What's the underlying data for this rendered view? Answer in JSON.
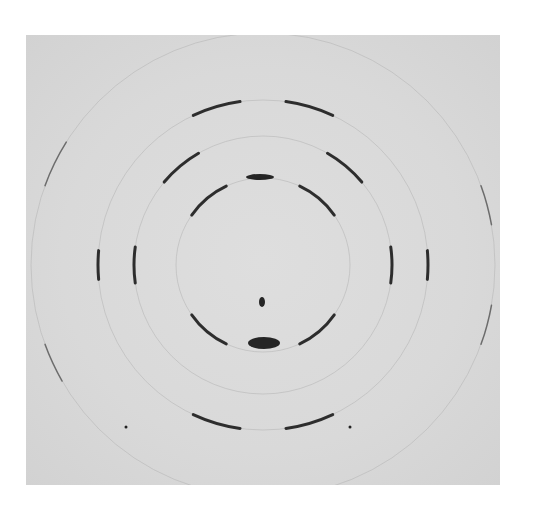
{
  "image": {
    "description": "Fiber X-ray diffraction photograph showing concentric rings with arc-shaped reflections",
    "background_color": "#dadada",
    "spot_color": "#111111",
    "center": [
      237,
      230
    ],
    "rings": [
      {
        "name": "inner",
        "radius": 87,
        "arcs": [
          [
            215,
            245
          ],
          [
            295,
            325
          ],
          [
            35,
            65
          ],
          [
            115,
            145
          ]
        ]
      },
      {
        "name": "middle",
        "radius": 129,
        "arcs": [
          [
            172,
            188
          ],
          [
            -8,
            8
          ],
          [
            220,
            240
          ],
          [
            300,
            320
          ]
        ]
      },
      {
        "name": "large",
        "radius": 165,
        "arcs": [
          [
            245,
            262
          ],
          [
            278,
            295
          ],
          [
            65,
            82
          ],
          [
            98,
            115
          ],
          [
            175,
            185
          ],
          [
            -5,
            5
          ]
        ]
      },
      {
        "name": "outer",
        "radius": 232,
        "arcs": [
          [
            150,
            160
          ],
          [
            200,
            212
          ],
          [
            -20,
            -10
          ],
          [
            10,
            20
          ]
        ]
      }
    ],
    "meridional_spots": [
      {
        "x": 234,
        "y": 142,
        "rx": 14,
        "ry": 3
      },
      {
        "x": 236,
        "y": 267,
        "rx": 3,
        "ry": 5
      },
      {
        "x": 238,
        "y": 308,
        "rx": 16,
        "ry": 6
      }
    ]
  }
}
